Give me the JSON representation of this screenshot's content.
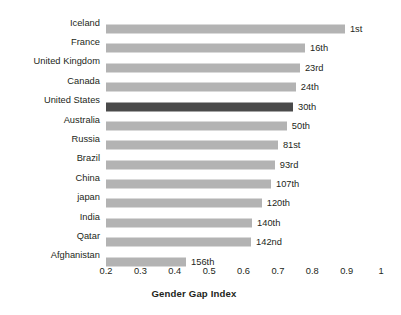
{
  "chart_data": {
    "type": "bar",
    "orientation": "horizontal",
    "title": "",
    "xlabel": "Gender Gap Index",
    "ylabel": "",
    "xlim": [
      0.2,
      1
    ],
    "grid": false,
    "legend": "none",
    "highlight_category": "United States",
    "highlight_color": "#4a4a4a",
    "bar_color": "#b3b3b3",
    "xticks": [
      "0.2",
      "0.3",
      "0.4",
      "0.5",
      "0.6",
      "0.7",
      "0.8",
      "0.9",
      "1"
    ],
    "xtick_values": [
      0.2,
      0.3,
      0.4,
      0.5,
      0.6,
      0.7,
      0.8,
      0.9,
      1
    ],
    "categories": [
      "Iceland",
      "France",
      "United Kingdom",
      "Canada",
      "United States",
      "Australia",
      "Russia",
      "Brazil",
      "China",
      "japan",
      "India",
      "Qatar",
      "Afghanistan"
    ],
    "values": [
      0.895,
      0.779,
      0.764,
      0.752,
      0.744,
      0.726,
      0.7,
      0.691,
      0.68,
      0.653,
      0.625,
      0.622,
      0.433
    ],
    "data_labels": [
      "1st",
      "16th",
      "23rd",
      "24th",
      "30th",
      "50th",
      "81st",
      "93rd",
      "107th",
      "120th",
      "140th",
      "142nd",
      "156th"
    ],
    "rows": [
      {
        "category": "Iceland",
        "value": 0.895,
        "rank": "1st",
        "highlight": false
      },
      {
        "category": "France",
        "value": 0.779,
        "rank": "16th",
        "highlight": false
      },
      {
        "category": "United Kingdom",
        "value": 0.764,
        "rank": "23rd",
        "highlight": false
      },
      {
        "category": "Canada",
        "value": 0.752,
        "rank": "24th",
        "highlight": false
      },
      {
        "category": "United States",
        "value": 0.744,
        "rank": "30th",
        "highlight": true
      },
      {
        "category": "Australia",
        "value": 0.726,
        "rank": "50th",
        "highlight": false
      },
      {
        "category": "Russia",
        "value": 0.7,
        "rank": "81st",
        "highlight": false
      },
      {
        "category": "Brazil",
        "value": 0.691,
        "rank": "93rd",
        "highlight": false
      },
      {
        "category": "China",
        "value": 0.68,
        "rank": "107th",
        "highlight": false
      },
      {
        "category": "japan",
        "value": 0.653,
        "rank": "120th",
        "highlight": false
      },
      {
        "category": "India",
        "value": 0.625,
        "rank": "140th",
        "highlight": false
      },
      {
        "category": "Qatar",
        "value": 0.622,
        "rank": "142nd",
        "highlight": false
      },
      {
        "category": "Afghanistan",
        "value": 0.433,
        "rank": "156th",
        "highlight": false
      }
    ]
  }
}
